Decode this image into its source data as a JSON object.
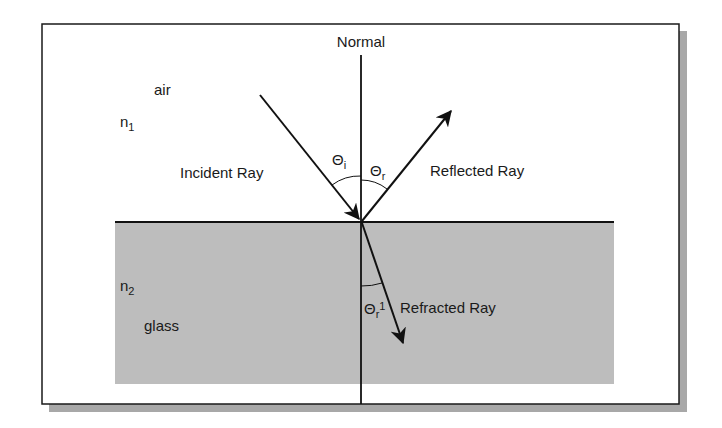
{
  "diagram": {
    "type": "refraction-reflection-diagram",
    "colors": {
      "background": "#ffffff",
      "frame": "#1a1a1a",
      "shadow": "#a8a8a8",
      "glass": "#bdbdbd",
      "line": "#111111"
    },
    "labels": {
      "normal": "Normal",
      "air": "air",
      "n1_base": "n",
      "n1_sub": "1",
      "n2_base": "n",
      "n2_sub": "2",
      "glass": "glass",
      "incident_ray": "Incident Ray",
      "reflected_ray": "Reflected Ray",
      "refracted_ray": "Refracted Ray",
      "theta_i_base": "Θ",
      "theta_i_sub": "i",
      "theta_r_base": "Θ",
      "theta_r_sub": "r",
      "theta_r1_base": "Θ",
      "theta_r1_sub": "r",
      "theta_r1_sup": "1"
    },
    "media": [
      {
        "name": "air",
        "index_label": "n1",
        "region": "upper"
      },
      {
        "name": "glass",
        "index_label": "n2",
        "region": "lower"
      }
    ],
    "rays": [
      {
        "name": "Incident Ray",
        "angle_label": "Θi",
        "direction": "toward interface"
      },
      {
        "name": "Reflected Ray",
        "angle_label": "Θr",
        "direction": "away from interface"
      },
      {
        "name": "Refracted Ray",
        "angle_label": "Θr1",
        "direction": "into glass"
      }
    ]
  }
}
